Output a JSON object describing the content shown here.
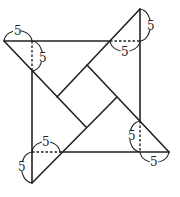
{
  "figure": {
    "stroke_color": "#222222",
    "labels": {
      "top_left_horizontal": "5",
      "top_left_vertical": "5",
      "top_right_vertical": "5",
      "top_right_horizontal": "5",
      "bottom_right_vertical": "5",
      "bottom_right_horizontal": "5",
      "bottom_left_horizontal": "5",
      "bottom_left_vertical": "5"
    }
  }
}
